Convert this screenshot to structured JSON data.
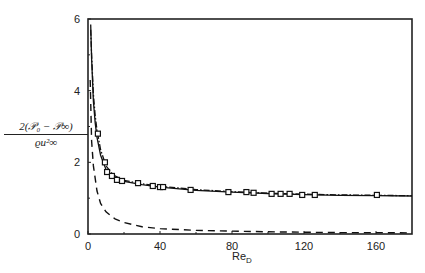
{
  "chart_data": {
    "type": "line",
    "title": "",
    "xlabel": "Re_D",
    "ylabel": "2(P0 - P∞) / (ρ u∞²)",
    "xlim": [
      0,
      180
    ],
    "ylim": [
      0,
      6
    ],
    "xticks": [
      0,
      40,
      80,
      120,
      160
    ],
    "yticks": [
      0,
      2,
      4,
      6
    ],
    "grid": false,
    "legend": null,
    "series": [
      {
        "name": "solid curve",
        "style": "solid",
        "x": [
          1.5,
          2,
          3,
          4,
          5,
          7,
          10,
          14,
          20,
          30,
          40,
          60,
          80,
          100,
          120,
          140,
          160,
          180
        ],
        "y": [
          5.85,
          4.9,
          3.7,
          3.1,
          2.7,
          2.2,
          1.8,
          1.6,
          1.47,
          1.38,
          1.31,
          1.22,
          1.17,
          1.13,
          1.1,
          1.08,
          1.07,
          1.06
        ]
      },
      {
        "name": "dash-dot curve",
        "style": "dashdot",
        "x": [
          1.5,
          2,
          3,
          4,
          5,
          7,
          10,
          14,
          20,
          30,
          40,
          60,
          80,
          100,
          120,
          140,
          160,
          180
        ],
        "y": [
          5.7,
          5.0,
          3.9,
          3.3,
          2.9,
          2.35,
          1.9,
          1.65,
          1.5,
          1.4,
          1.33,
          1.24,
          1.18,
          1.14,
          1.11,
          1.09,
          1.08,
          1.07
        ]
      },
      {
        "name": "dashed curve",
        "style": "dashed",
        "x": [
          1.2,
          2,
          3,
          5,
          7,
          10,
          15,
          20,
          30,
          40,
          60,
          80,
          100,
          120,
          140,
          160,
          180
        ],
        "y": [
          4.3,
          2.6,
          1.9,
          1.2,
          0.85,
          0.62,
          0.42,
          0.32,
          0.2,
          0.15,
          0.1,
          0.08,
          0.06,
          0.05,
          0.04,
          0.04,
          0.03
        ]
      },
      {
        "name": "experimental data",
        "style": "markers",
        "marker": "square",
        "x": [
          5.5,
          9.4,
          10.6,
          13.3,
          16.1,
          18.9,
          27.8,
          36,
          40,
          41.7,
          57,
          78,
          88,
          92,
          102,
          107,
          112,
          119,
          126,
          160.5
        ],
        "y": [
          2.8,
          2.0,
          1.73,
          1.62,
          1.51,
          1.48,
          1.42,
          1.34,
          1.31,
          1.31,
          1.23,
          1.17,
          1.17,
          1.15,
          1.12,
          1.12,
          1.12,
          1.09,
          1.09,
          1.09
        ]
      }
    ]
  },
  "labels": {
    "y_numerator": "2(𝒫₀ − 𝒫∞)",
    "y_denominator": "ϱu²∞",
    "x_main": "Re",
    "x_sub": "D"
  },
  "ticks": {
    "x": [
      "0",
      "40",
      "80",
      "120",
      "160"
    ],
    "y": [
      "0",
      "2",
      "4",
      "6"
    ]
  }
}
